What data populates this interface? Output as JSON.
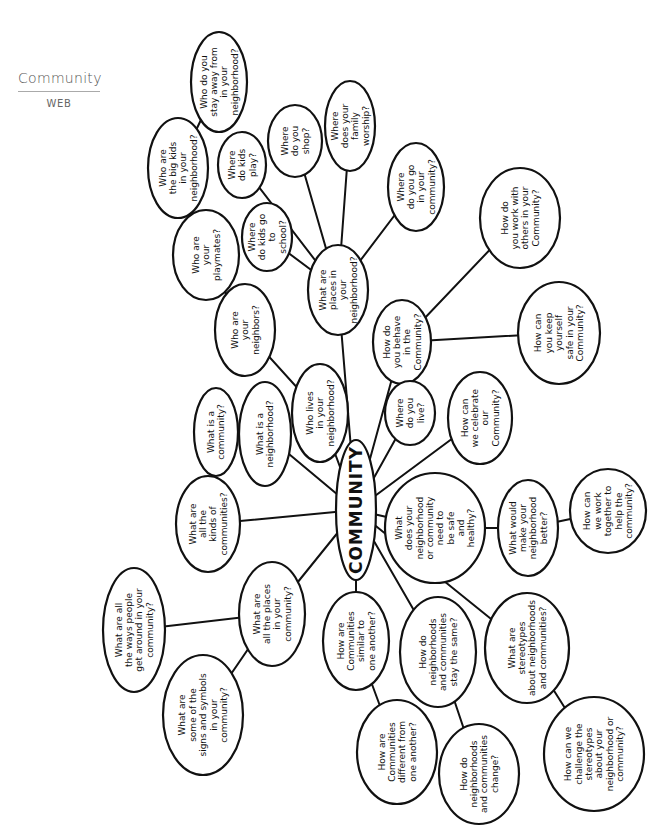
{
  "header": {
    "title": "Community",
    "subtitle": "WEB"
  },
  "center": {
    "label": "COMMUNITY",
    "x": 356,
    "y": 510,
    "rx": 20,
    "ry": 70
  },
  "nodes": [
    {
      "id": "n1",
      "lines": [
        "Who do you",
        "stay away from",
        "in your",
        "neighborhood?"
      ],
      "x": 219,
      "y": 82,
      "rx": 28,
      "ry": 50,
      "parent": "n2"
    },
    {
      "id": "n2",
      "lines": [
        "Who are",
        "the big kids",
        "in your",
        "neighborhood?"
      ],
      "x": 178,
      "y": 168,
      "rx": 30,
      "ry": 50,
      "parent": "n3"
    },
    {
      "id": "n3",
      "lines": [
        "Who are",
        "your",
        "playmates?"
      ],
      "x": 206,
      "y": 255,
      "rx": 33,
      "ry": 45,
      "parent": "n4"
    },
    {
      "id": "n4",
      "lines": [
        "Who are",
        "your",
        "neighbors?"
      ],
      "x": 245,
      "y": 330,
      "rx": 30,
      "ry": 46,
      "parent": "n5"
    },
    {
      "id": "n5",
      "lines": [
        "Who lives",
        "in your",
        "neighborhood?"
      ],
      "x": 320,
      "y": 413,
      "rx": 28,
      "ry": 49,
      "parent": "center"
    },
    {
      "id": "n6",
      "lines": [
        "Where",
        "do kids",
        "play?"
      ],
      "x": 242,
      "y": 165,
      "rx": 24,
      "ry": 33,
      "parent": "n10"
    },
    {
      "id": "n7",
      "lines": [
        "Where",
        "do you",
        "shop?"
      ],
      "x": 295,
      "y": 141,
      "rx": 27,
      "ry": 36,
      "parent": "n10"
    },
    {
      "id": "n8",
      "lines": [
        "Where",
        "does your",
        "family",
        "worship?"
      ],
      "x": 350,
      "y": 126,
      "rx": 25,
      "ry": 45,
      "parent": "n10"
    },
    {
      "id": "n9",
      "lines": [
        "Where",
        "do you go",
        "in your",
        "community?"
      ],
      "x": 416,
      "y": 187,
      "rx": 28,
      "ry": 44,
      "parent": "n10"
    },
    {
      "id": "n10",
      "lines": [
        "What are",
        "places in",
        "your",
        "neighborhood?"
      ],
      "x": 338,
      "y": 290,
      "rx": 30,
      "ry": 45,
      "parent": "center"
    },
    {
      "id": "n11",
      "lines": [
        "Where",
        "do kids go",
        "to",
        "school?"
      ],
      "x": 267,
      "y": 237,
      "rx": 25,
      "ry": 34,
      "parent": "n10"
    },
    {
      "id": "n12",
      "lines": [
        "How do",
        "you work with",
        "others in your",
        "Community?"
      ],
      "x": 520,
      "y": 218,
      "rx": 40,
      "ry": 50,
      "parent": "n13"
    },
    {
      "id": "n13",
      "lines": [
        "How do",
        "you behave",
        "in the",
        "Community?"
      ],
      "x": 402,
      "y": 342,
      "rx": 29,
      "ry": 42,
      "parent": "center"
    },
    {
      "id": "n14",
      "lines": [
        "How can",
        "you keep",
        "yourself",
        "safe in your",
        "Community?"
      ],
      "x": 559,
      "y": 333,
      "rx": 41,
      "ry": 51,
      "parent": "n13"
    },
    {
      "id": "n15",
      "lines": [
        "Where",
        "do you",
        "live?"
      ],
      "x": 410,
      "y": 413,
      "rx": 25,
      "ry": 32,
      "parent": "center"
    },
    {
      "id": "n16",
      "lines": [
        "How can",
        "we celebrate",
        "our",
        "Community?"
      ],
      "x": 480,
      "y": 418,
      "rx": 32,
      "ry": 46,
      "parent": "center"
    },
    {
      "id": "n17",
      "lines": [
        "What is a",
        "community?"
      ],
      "x": 216,
      "y": 432,
      "rx": 22,
      "ry": 44,
      "parent": "n18"
    },
    {
      "id": "n18",
      "lines": [
        "What is a",
        "neighborhood?"
      ],
      "x": 265,
      "y": 434,
      "rx": 26,
      "ry": 52,
      "parent": "center"
    },
    {
      "id": "n19",
      "lines": [
        "What are",
        "all the",
        "kinds of",
        "communities?"
      ],
      "x": 208,
      "y": 524,
      "rx": 32,
      "ry": 48,
      "parent": "center"
    },
    {
      "id": "n20",
      "lines": [
        "What",
        "does your",
        "neighborhood",
        "or community",
        "need to",
        "be safe",
        "and",
        "healthy?"
      ],
      "x": 435,
      "y": 528,
      "rx": 50,
      "ry": 55,
      "parent": "center"
    },
    {
      "id": "n21",
      "lines": [
        "What would",
        "make your",
        "neighborhood",
        "better?"
      ],
      "x": 528,
      "y": 528,
      "rx": 30,
      "ry": 48,
      "parent": "n20"
    },
    {
      "id": "n22",
      "lines": [
        "How can",
        "we work",
        "together to",
        "help the",
        "community?"
      ],
      "x": 608,
      "y": 511,
      "rx": 38,
      "ry": 42,
      "parent": "n21"
    },
    {
      "id": "n23",
      "lines": [
        "What are all",
        "the ways people",
        "get around in your",
        "community?"
      ],
      "x": 134,
      "y": 630,
      "rx": 31,
      "ry": 62,
      "parent": "n24"
    },
    {
      "id": "n24",
      "lines": [
        "What are",
        "all the places",
        "in your",
        "community?"
      ],
      "x": 272,
      "y": 614,
      "rx": 33,
      "ry": 52,
      "parent": "center"
    },
    {
      "id": "n25",
      "lines": [
        "What are",
        "some of the",
        "signs and symbols",
        "in your",
        "community?"
      ],
      "x": 203,
      "y": 715,
      "rx": 40,
      "ry": 60,
      "parent": "n24"
    },
    {
      "id": "n26",
      "lines": [
        "How are",
        "Communities",
        "similar to",
        "one another?"
      ],
      "x": 356,
      "y": 641,
      "rx": 33,
      "ry": 49,
      "parent": "center"
    },
    {
      "id": "n27",
      "lines": [
        "How do",
        "neighborhoods",
        "and communities",
        "stay the same?"
      ],
      "x": 438,
      "y": 652,
      "rx": 38,
      "ry": 55,
      "parent": "center"
    },
    {
      "id": "n28",
      "lines": [
        "What are",
        "stereotypes",
        "about neighborhoods",
        "and communities?"
      ],
      "x": 527,
      "y": 648,
      "rx": 42,
      "ry": 55,
      "parent": "center"
    },
    {
      "id": "n29",
      "lines": [
        "How are",
        "Communities",
        "different from",
        "one another?"
      ],
      "x": 397,
      "y": 752,
      "rx": 40,
      "ry": 52,
      "parent": "n26"
    },
    {
      "id": "n30",
      "lines": [
        "How do",
        "neighborhoods",
        "and communities",
        "change?"
      ],
      "x": 479,
      "y": 774,
      "rx": 40,
      "ry": 50,
      "parent": "n27"
    },
    {
      "id": "n31",
      "lines": [
        "How can we",
        "challenge the",
        "stereotypes",
        "about your",
        "neighborhood or",
        "community?"
      ],
      "x": 594,
      "y": 754,
      "rx": 50,
      "ry": 57,
      "parent": "n28"
    }
  ]
}
